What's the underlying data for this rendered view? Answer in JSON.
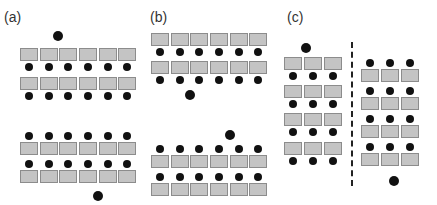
{
  "figure": {
    "colors": {
      "desk_fill": "#c4c4c4",
      "desk_border": "#8c8c8c",
      "person": "#111111",
      "background": "#ffffff"
    },
    "panels": [
      {
        "label": "(a)",
        "layouts": [
          {
            "orientation": "students-below-desks",
            "rows": 2,
            "desks_per_row": 6,
            "teacher_position": "top"
          },
          {
            "orientation": "students-above-desks",
            "rows": 2,
            "desks_per_row": 6,
            "teacher_position": "bottom"
          }
        ]
      },
      {
        "label": "(b)",
        "layouts": [
          {
            "orientation": "students-below-desks",
            "rows": 2,
            "desks_per_row": 6,
            "teacher_position": "bottom"
          },
          {
            "orientation": "students-above-desks",
            "rows": 2,
            "desks_per_row": 6,
            "teacher_position": "top"
          }
        ]
      },
      {
        "label": "(c)",
        "layouts": [
          {
            "orientation": "students-below-desks",
            "rows": 4,
            "desks_per_row": 3,
            "teacher_position": "top"
          },
          {
            "orientation": "students-above-desks",
            "rows": 4,
            "desks_per_row": 3,
            "teacher_position": "bottom"
          }
        ],
        "separator": "dashed-vertical-line"
      }
    ]
  }
}
